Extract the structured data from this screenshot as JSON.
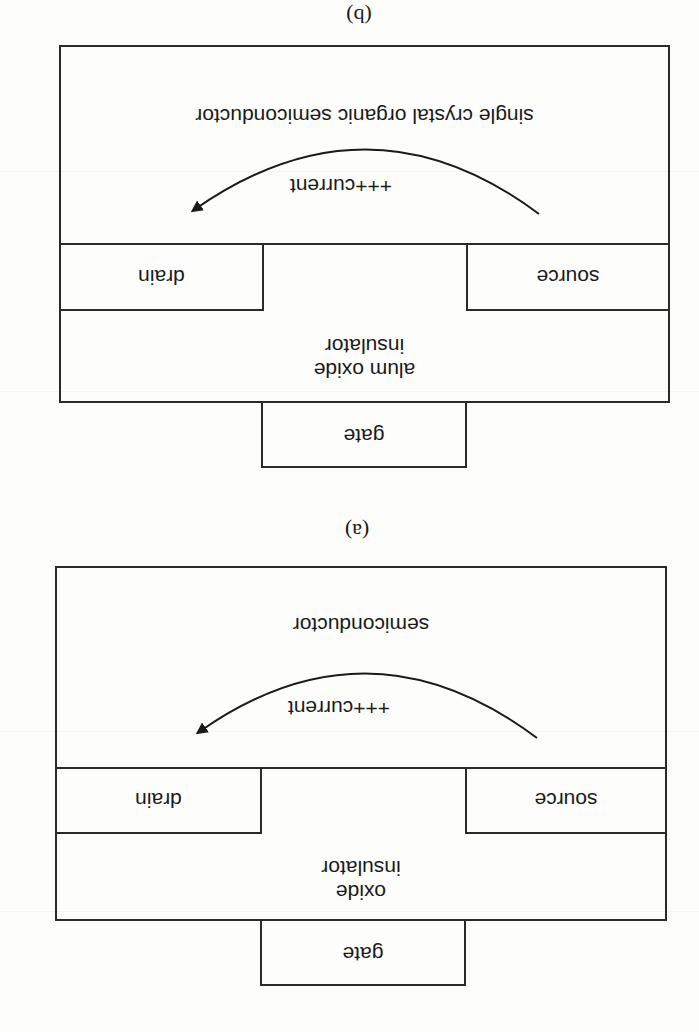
{
  "figure": {
    "orientation": "rotated 180 degrees (scanned upside down)",
    "panels": [
      {
        "id": "a",
        "caption": "(a)",
        "layers": {
          "semiconductor": "semiconductor",
          "current": "+++current",
          "source": "source",
          "drain": "drain",
          "insulator_line1": "oxide",
          "insulator_line2": "insulator",
          "gate": "gate"
        }
      },
      {
        "id": "b",
        "caption": "(b)",
        "layers": {
          "semiconductor": "single crystal organic semiconductor",
          "current": "+++current",
          "source": "source",
          "drain": "drain",
          "insulator_line1": "alum oxide",
          "insulator_line2": "insulator",
          "gate": "gate"
        }
      }
    ]
  },
  "colors": {
    "line": "#2a2a2a",
    "text": "#1a1a1a",
    "background": "#fdfdfc"
  }
}
